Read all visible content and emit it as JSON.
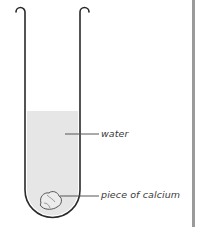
{
  "diagram": {
    "type": "test-tube-apparatus",
    "labels": {
      "water": "water",
      "calcium": "piece of calcium"
    },
    "colors": {
      "tube_outline": "#2a2a2a",
      "water_fill": "#e6e6e6",
      "calcium_fill": "#ececec",
      "calcium_outline": "#555555",
      "leader_line": "#555555",
      "right_border": "#9a9a9a"
    }
  }
}
